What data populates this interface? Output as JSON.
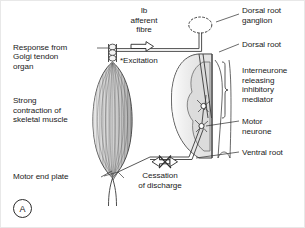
{
  "figure": {
    "panel_label": "A",
    "labels": {
      "golgi": "Response from\nGolgi tendon\norgan",
      "strong_contraction": "Strong\ncontraction of\nskeletal muscle",
      "motor_end_plate": "Motor end plate",
      "ib_afferent": "Ib\nafferent\nfibre",
      "excitation": "*Excitation",
      "cessation": "Cessation\nof discharge",
      "dorsal_root_ganglion": "Dorsal root\nganglion",
      "dorsal_root": "Dorsal root",
      "interneurone": "Interneurone\nreleasing\ninhibitory\nmediator",
      "motor_neurone": "Motor\nneurone",
      "ventral_root": "Ventral root"
    },
    "colors": {
      "ink": "#2b2b2b",
      "text": "#1a1a1a",
      "muscle_fill": "#cfcfcf",
      "grey_matter": "#dcdcdc",
      "background": "#ffffff"
    },
    "structures": {
      "muscle": "skeletal-muscle-spindle",
      "golgi_tendon_organ": "chain-of-receptor-circles",
      "spinal_cord": "cord-cross-section-with-grey-matter",
      "ganglion": "oval-dorsal-root-ganglion",
      "synapses": [
        "interneurone-cell-body",
        "motor-neurone-cell-body"
      ],
      "arrows": [
        "excitation-arrow-right",
        "cessation-arrow-left-crossed"
      ]
    }
  }
}
